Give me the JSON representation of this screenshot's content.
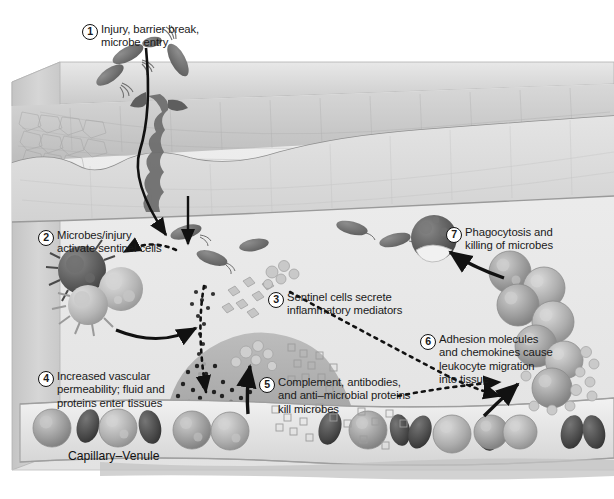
{
  "figure": {
    "background_color": "#ffffff",
    "ink_color": "#1a1a1a"
  },
  "steps": [
    {
      "number": "1",
      "lines": [
        "Injury, barrier break,",
        "microbe entry"
      ]
    },
    {
      "number": "2",
      "lines": [
        "Microbes/injury",
        "activate sentinel cells"
      ]
    },
    {
      "number": "3",
      "lines": [
        "Sentinel cells secrete",
        "inflammatory mediators"
      ]
    },
    {
      "number": "4",
      "lines": [
        "Increased vascular",
        "permeability; fluid and",
        "proteins enter tissues"
      ]
    },
    {
      "number": "5",
      "lines": [
        "Complement, antibodies,",
        "and anti–microbial proteins",
        "kill microbes"
      ]
    },
    {
      "number": "6",
      "lines": [
        "Adhesion molecules",
        "and chemokines cause",
        "leukocyte migration",
        "into tissue"
      ]
    },
    {
      "number": "7",
      "lines": [
        "Phagocytosis and",
        "killing of microbes"
      ]
    }
  ],
  "anatomy": {
    "vessel_label": "Capillary–Venule",
    "layers": [
      {
        "name": "epidermis",
        "color": "#cfcfcf"
      },
      {
        "name": "dermis",
        "color": "#dedede"
      },
      {
        "name": "subcutis",
        "color": "#e9e9e9"
      },
      {
        "name": "block-side-face",
        "color": "#c8c8c8"
      },
      {
        "name": "block-top-face",
        "color": "#d8d8d8"
      }
    ]
  },
  "elements": {
    "microbes_label": "rod-shaped bacteria with flagella",
    "sentinel_cells_label": "macrophage, mast cell, dendritic cell",
    "mediators_label": "inflammatory mediator granules",
    "complement_label": "complement and antibody proteins",
    "leukocytes_label": "migrating leukocytes",
    "rbc_label": "red blood cells",
    "phagocyte_label": "phagocyte engulfing microbe",
    "edema_label": "edema fluid in tissue"
  },
  "colors": {
    "microbe": "#6d6d6d",
    "macrophage": "#5a5a5a",
    "mast_cell": "#b9b9b9",
    "leukocyte": "#9a9a9a",
    "rbc": "#4a4a4a",
    "arrow": "#111111",
    "mediator": "#c2c2c2"
  }
}
